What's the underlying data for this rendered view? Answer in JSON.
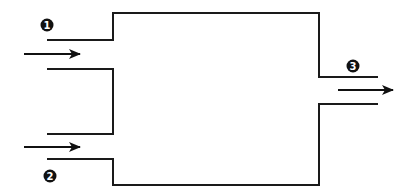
{
  "diagram": {
    "type": "flow-mixing-chamber",
    "colors": {
      "line": "#1a1a1a",
      "badge": "#111111",
      "badge_text": "#ffffff",
      "background": "#ffffff"
    },
    "streams": [
      {
        "id": "1",
        "label": "1",
        "role": "inlet",
        "direction": "right"
      },
      {
        "id": "2",
        "label": "2",
        "role": "inlet",
        "direction": "right"
      },
      {
        "id": "3",
        "label": "3",
        "role": "outlet",
        "direction": "right"
      }
    ]
  }
}
